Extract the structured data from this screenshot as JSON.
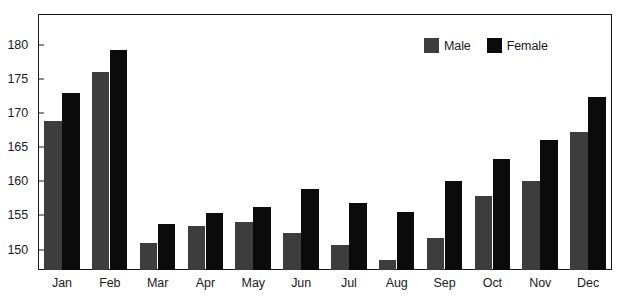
{
  "chart_data": {
    "type": "bar",
    "title": "",
    "subtitle": "",
    "xlabel": "",
    "ylabel": "",
    "categories": [
      "Jan",
      "Feb",
      "Mar",
      "Apr",
      "May",
      "Jun",
      "Jul",
      "Aug",
      "Sep",
      "Oct",
      "Nov",
      "Dec"
    ],
    "series": [
      {
        "name": "Male",
        "color": "#3d3d3d",
        "values": [
          168.8,
          176.0,
          151.0,
          153.4,
          154.0,
          152.4,
          150.6,
          148.5,
          151.7,
          157.8,
          160.0,
          167.2
        ]
      },
      {
        "name": "Female",
        "color": "#0b0b0b",
        "values": [
          173.0,
          179.2,
          153.8,
          155.4,
          156.2,
          158.8,
          156.8,
          155.5,
          160.0,
          163.2,
          166.0,
          172.4
        ]
      }
    ],
    "yticks": [
      150,
      155,
      160,
      165,
      170,
      175,
      180
    ],
    "ytick_labels": [
      "150",
      "155",
      "160",
      "165",
      "170",
      "175",
      "180"
    ],
    "ylim": [
      147.0,
      184.5
    ],
    "grid": false,
    "legend": {
      "position": "top-right",
      "entries": [
        {
          "label": "Male",
          "swatch": "male-swatch",
          "color": "#3d3d3d"
        },
        {
          "label": "Female",
          "swatch": "female-swatch",
          "color": "#0b0b0b"
        }
      ]
    },
    "frame": {
      "border_color": "#1a1a1a",
      "background": "#ffffff"
    }
  }
}
